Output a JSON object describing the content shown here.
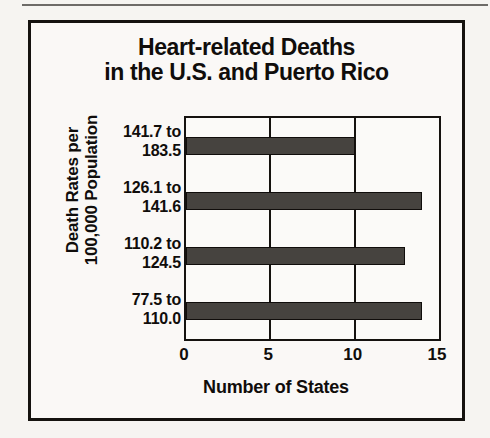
{
  "page": {
    "background_color": "#f6f4f1",
    "frame_color": "#15120f"
  },
  "chart_data": {
    "type": "bar",
    "orientation": "horizontal",
    "title": "Heart-related Deaths in the U.S. and Puerto Rico",
    "title_lines": [
      "Heart-related Deaths",
      "in the U.S. and Puerto Rico"
    ],
    "xlabel": "Number of States",
    "ylabel": "Death Rates per 100,000 Population",
    "ylabel_lines": [
      "Death Rates per",
      "100,000 Population"
    ],
    "categories": [
      "141.7 to 183.5",
      "126.1 to 141.6",
      "110.2 to 124.5",
      "77.5 to 110.0"
    ],
    "category_lines": [
      [
        "141.7 to",
        "183.5"
      ],
      [
        "126.1 to",
        "141.6"
      ],
      [
        "110.2 to",
        "124.5"
      ],
      [
        "77.5 to",
        "110.0"
      ]
    ],
    "values": [
      10,
      14,
      13,
      14
    ],
    "xlim": [
      0,
      15
    ],
    "xticks": [
      0,
      5,
      10,
      15
    ],
    "xtick_labels": [
      "0",
      "5",
      "10",
      "15"
    ],
    "grid": true,
    "grid_axis": "x",
    "legend": false,
    "bar_color": "#46433f",
    "bar_edge_color": "#100d0b"
  }
}
